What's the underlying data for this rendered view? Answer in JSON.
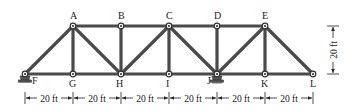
{
  "figure": {
    "type": "truss"
  },
  "colors": {
    "member": "#4a4a4a",
    "text": "#222222",
    "background": "#ffffff"
  },
  "joints": [
    {
      "id": "A",
      "x": 73,
      "y": 26,
      "label_dx": -3,
      "label_dy": -7
    },
    {
      "id": "B",
      "x": 121,
      "y": 26,
      "label_dx": -3,
      "label_dy": -7
    },
    {
      "id": "C",
      "x": 169,
      "y": 26,
      "label_dx": -3,
      "label_dy": -7
    },
    {
      "id": "D",
      "x": 217,
      "y": 26,
      "label_dx": -3,
      "label_dy": -7
    },
    {
      "id": "E",
      "x": 265,
      "y": 26,
      "label_dx": -3,
      "label_dy": -7
    },
    {
      "id": "F",
      "x": 25,
      "y": 74,
      "label_dx": 7,
      "label_dy": 10
    },
    {
      "id": "G",
      "x": 73,
      "y": 74,
      "label_dx": -4,
      "label_dy": 13
    },
    {
      "id": "H",
      "x": 121,
      "y": 74,
      "label_dx": -5,
      "label_dy": 13
    },
    {
      "id": "I",
      "x": 169,
      "y": 74,
      "label_dx": -3,
      "label_dy": 13
    },
    {
      "id": "J",
      "x": 217,
      "y": 74,
      "label_dx": -10,
      "label_dy": 10
    },
    {
      "id": "K",
      "x": 265,
      "y": 74,
      "label_dx": -4,
      "label_dy": 13
    },
    {
      "id": "L",
      "x": 313,
      "y": 74,
      "label_dx": -3,
      "label_dy": 13
    }
  ],
  "members": [
    [
      "F",
      "G"
    ],
    [
      "G",
      "H"
    ],
    [
      "H",
      "I"
    ],
    [
      "I",
      "J"
    ],
    [
      "J",
      "K"
    ],
    [
      "K",
      "L"
    ],
    [
      "A",
      "B"
    ],
    [
      "B",
      "C"
    ],
    [
      "C",
      "D"
    ],
    [
      "D",
      "E"
    ],
    [
      "A",
      "G"
    ],
    [
      "B",
      "H"
    ],
    [
      "C",
      "I"
    ],
    [
      "D",
      "J"
    ],
    [
      "E",
      "K"
    ],
    [
      "F",
      "A"
    ],
    [
      "A",
      "H"
    ],
    [
      "H",
      "C"
    ],
    [
      "C",
      "J"
    ],
    [
      "J",
      "E"
    ],
    [
      "E",
      "L"
    ]
  ],
  "supports": [
    {
      "joint": "F",
      "type": "pin"
    },
    {
      "joint": "J",
      "type": "roller"
    }
  ],
  "dimensions": {
    "horizontal": {
      "y": 98,
      "segments": [
        {
          "from": 25,
          "to": 73,
          "label": "20 ft"
        },
        {
          "from": 73,
          "to": 121,
          "label": "20 ft"
        },
        {
          "from": 121,
          "to": 169,
          "label": "20 ft"
        },
        {
          "from": 169,
          "to": 217,
          "label": "20 ft"
        },
        {
          "from": 217,
          "to": 265,
          "label": "20 ft"
        },
        {
          "from": 265,
          "to": 313,
          "label": "20 ft"
        }
      ]
    },
    "vertical": {
      "x": 333,
      "from": 26,
      "to": 74,
      "label": "20 ft"
    }
  }
}
